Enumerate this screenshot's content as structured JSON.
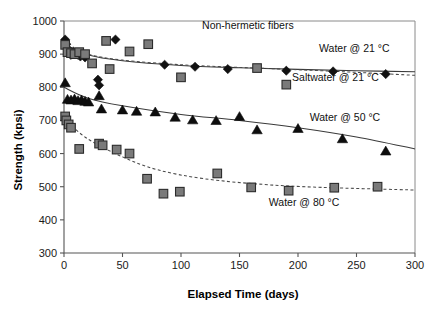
{
  "chart_data": {
    "type": "scatter",
    "title": "Non-hermetic fibers",
    "xlabel": "Elapsed Time (days)",
    "ylabel": "Strength (kpsi)",
    "xlim": [
      0,
      300
    ],
    "ylim": [
      300,
      1000
    ],
    "xticks": [
      0,
      50,
      100,
      150,
      200,
      250,
      300
    ],
    "yticks": [
      300,
      400,
      500,
      600,
      700,
      800,
      900,
      1000
    ],
    "grid": false,
    "legend_position": "inline-annotations",
    "annotations": [
      {
        "text": "Non-hermetic fibers",
        "x": 118,
        "y": 975
      },
      {
        "text": "Water @ 21 °C",
        "x": 218,
        "y": 907
      },
      {
        "text": "Saltwater @ 21 °C",
        "x": 195,
        "y": 820
      },
      {
        "text": "Water @ 50 °C",
        "x": 210,
        "y": 697
      },
      {
        "text": "Water @ 80 °C",
        "x": 175,
        "y": 443
      }
    ],
    "series": [
      {
        "name": "Water @ 21 °C",
        "marker": "diamond",
        "color": "#111111",
        "fit_style": "solid",
        "points": [
          {
            "x": 1,
            "y": 944
          },
          {
            "x": 2,
            "y": 930
          },
          {
            "x": 3,
            "y": 917
          },
          {
            "x": 4,
            "y": 905
          },
          {
            "x": 6,
            "y": 898
          },
          {
            "x": 8,
            "y": 908
          },
          {
            "x": 12,
            "y": 898
          },
          {
            "x": 14,
            "y": 893
          },
          {
            "x": 18,
            "y": 890
          },
          {
            "x": 29,
            "y": 823
          },
          {
            "x": 30,
            "y": 806
          },
          {
            "x": 44,
            "y": 944
          },
          {
            "x": 86,
            "y": 868
          },
          {
            "x": 112,
            "y": 862
          },
          {
            "x": 140,
            "y": 855
          },
          {
            "x": 190,
            "y": 850
          },
          {
            "x": 230,
            "y": 848
          },
          {
            "x": 275,
            "y": 840
          }
        ],
        "fit": [
          {
            "x": 0,
            "y": 930
          },
          {
            "x": 20,
            "y": 898
          },
          {
            "x": 50,
            "y": 880
          },
          {
            "x": 100,
            "y": 866
          },
          {
            "x": 150,
            "y": 859
          },
          {
            "x": 200,
            "y": 854
          },
          {
            "x": 250,
            "y": 850
          },
          {
            "x": 300,
            "y": 847
          }
        ]
      },
      {
        "name": "Saltwater @ 21 °C",
        "marker": "square",
        "color": "#7a7a7a",
        "fit_style": "dashed",
        "points": [
          {
            "x": 1,
            "y": 928
          },
          {
            "x": 3,
            "y": 906
          },
          {
            "x": 6,
            "y": 903
          },
          {
            "x": 9,
            "y": 900
          },
          {
            "x": 13,
            "y": 906
          },
          {
            "x": 18,
            "y": 900
          },
          {
            "x": 24,
            "y": 872
          },
          {
            "x": 36,
            "y": 940
          },
          {
            "x": 39,
            "y": 855
          },
          {
            "x": 56,
            "y": 908
          },
          {
            "x": 72,
            "y": 930
          },
          {
            "x": 100,
            "y": 830
          },
          {
            "x": 165,
            "y": 858
          },
          {
            "x": 190,
            "y": 808
          }
        ],
        "fit": [
          {
            "x": 0,
            "y": 930
          },
          {
            "x": 20,
            "y": 900
          },
          {
            "x": 50,
            "y": 882
          },
          {
            "x": 100,
            "y": 868
          },
          {
            "x": 150,
            "y": 860
          },
          {
            "x": 200,
            "y": 853
          },
          {
            "x": 250,
            "y": 845
          },
          {
            "x": 300,
            "y": 836
          }
        ]
      },
      {
        "name": "Water @ 50 °C",
        "marker": "triangle",
        "color": "#0d0d0d",
        "fit_style": "solid",
        "points": [
          {
            "x": 1,
            "y": 814
          },
          {
            "x": 3,
            "y": 764
          },
          {
            "x": 6,
            "y": 762
          },
          {
            "x": 9,
            "y": 765
          },
          {
            "x": 12,
            "y": 760
          },
          {
            "x": 15,
            "y": 762
          },
          {
            "x": 18,
            "y": 758
          },
          {
            "x": 21,
            "y": 756
          },
          {
            "x": 30,
            "y": 775
          },
          {
            "x": 32,
            "y": 735
          },
          {
            "x": 50,
            "y": 732
          },
          {
            "x": 62,
            "y": 728
          },
          {
            "x": 78,
            "y": 726
          },
          {
            "x": 95,
            "y": 710
          },
          {
            "x": 110,
            "y": 702
          },
          {
            "x": 130,
            "y": 700
          },
          {
            "x": 150,
            "y": 712
          },
          {
            "x": 165,
            "y": 672
          },
          {
            "x": 200,
            "y": 676
          },
          {
            "x": 238,
            "y": 645
          },
          {
            "x": 275,
            "y": 608
          }
        ],
        "fit": [
          {
            "x": 0,
            "y": 800
          },
          {
            "x": 20,
            "y": 768
          },
          {
            "x": 50,
            "y": 744
          },
          {
            "x": 100,
            "y": 718
          },
          {
            "x": 150,
            "y": 700
          },
          {
            "x": 200,
            "y": 678
          },
          {
            "x": 250,
            "y": 650
          },
          {
            "x": 300,
            "y": 614
          }
        ]
      },
      {
        "name": "Water @ 80 °C",
        "marker": "square",
        "color": "#7a7a7a",
        "fit_style": "dashed",
        "points": [
          {
            "x": 1,
            "y": 712
          },
          {
            "x": 2,
            "y": 700
          },
          {
            "x": 4,
            "y": 688
          },
          {
            "x": 6,
            "y": 678
          },
          {
            "x": 13,
            "y": 614
          },
          {
            "x": 30,
            "y": 630
          },
          {
            "x": 33,
            "y": 625
          },
          {
            "x": 45,
            "y": 612
          },
          {
            "x": 56,
            "y": 600
          },
          {
            "x": 71,
            "y": 524
          },
          {
            "x": 85,
            "y": 479
          },
          {
            "x": 99,
            "y": 485
          },
          {
            "x": 131,
            "y": 540
          },
          {
            "x": 160,
            "y": 498
          },
          {
            "x": 192,
            "y": 488
          },
          {
            "x": 231,
            "y": 497
          },
          {
            "x": 268,
            "y": 500
          }
        ],
        "fit": [
          {
            "x": 0,
            "y": 705
          },
          {
            "x": 20,
            "y": 645
          },
          {
            "x": 50,
            "y": 590
          },
          {
            "x": 80,
            "y": 551
          },
          {
            "x": 120,
            "y": 524
          },
          {
            "x": 170,
            "y": 507
          },
          {
            "x": 220,
            "y": 498
          },
          {
            "x": 300,
            "y": 490
          }
        ]
      }
    ]
  }
}
